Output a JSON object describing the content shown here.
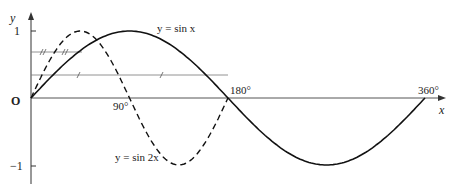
{
  "axes": {
    "x_label": "x",
    "y_label": "y",
    "origin_label": "O",
    "y_ticks": [
      {
        "label": "1",
        "value": 1
      },
      {
        "label": "−1",
        "value": -1
      }
    ],
    "x_ticks": [
      {
        "label": "90°",
        "value": 90
      },
      {
        "label": "180°",
        "value": 180
      },
      {
        "label": "360°",
        "value": 360
      }
    ]
  },
  "curves": {
    "sin_x": {
      "label": "y = sin x",
      "style": "solid"
    },
    "sin_2x": {
      "label": "y = sin 2x",
      "style": "dashed"
    }
  },
  "labels": {
    "y1": "1",
    "ym1": "−1",
    "x90": "90°",
    "x180": "180°",
    "x360": "360°"
  },
  "colors": {
    "ink": "#222222",
    "background": "#ffffff"
  }
}
